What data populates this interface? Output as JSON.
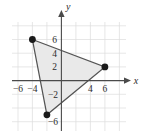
{
  "chart_data": {
    "type": "scatter",
    "title": "",
    "subtitle": "",
    "xlabel": "x",
    "ylabel": "y",
    "xlim": [
      -8.2,
      8.8
    ],
    "ylim": [
      -8.2,
      8.2
    ],
    "grid": true,
    "grid_step": 2,
    "legend": "none",
    "x_ticks": [
      -6,
      -4,
      4,
      6
    ],
    "x_tick_labels": [
      "−6",
      "−4",
      "4",
      "6"
    ],
    "y_ticks": [
      6,
      4,
      2,
      -2,
      -6
    ],
    "y_tick_labels": [
      "6",
      "4",
      "2",
      "−2",
      "−6"
    ],
    "series": [
      {
        "name": "triangle",
        "type": "polygon",
        "closed": true,
        "fill_color": "#e9e9e9",
        "stroke_color": "#545454",
        "points": [
          {
            "label": "A",
            "x": -4,
            "y": 6
          },
          {
            "label": "B",
            "x": 6,
            "y": 2
          },
          {
            "label": "C",
            "x": -2,
            "y": -5
          }
        ]
      }
    ],
    "vertex_marker": "filled-circle",
    "vertex_color": "#1a1a1a"
  },
  "axes": {
    "x_axis_label": "x",
    "y_axis_label": "y",
    "x_arrow": "right",
    "y_arrow": "up"
  },
  "colors": {
    "grid": "#dcdcdc",
    "axis": "#4a4a4a",
    "fill": "#e9e9e9",
    "outline": "#545454",
    "point": "#1a1a1a",
    "text": "#2b2b2b",
    "background": "#ffffff"
  }
}
